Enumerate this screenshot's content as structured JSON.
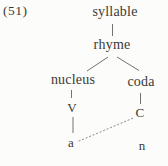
{
  "figure": {
    "label": "(51)"
  },
  "tree": {
    "title": "syllable structure tree",
    "nodes": [
      {
        "id": "syllable",
        "label": "syllable",
        "level": 0
      },
      {
        "id": "rhyme",
        "label": "rhyme",
        "level": 1
      },
      {
        "id": "nucleus",
        "label": "nucleus",
        "level": 2
      },
      {
        "id": "coda",
        "label": "coda",
        "level": 2
      },
      {
        "id": "v",
        "label": "V",
        "level": 3
      },
      {
        "id": "c",
        "label": "C",
        "level": 3
      },
      {
        "id": "a",
        "label": "a",
        "level": 4
      },
      {
        "id": "n",
        "label": "n",
        "level": 4
      }
    ],
    "edges": [
      {
        "from": "syllable",
        "to": "rhyme",
        "style": "solid"
      },
      {
        "from": "rhyme",
        "to": "nucleus",
        "style": "solid"
      },
      {
        "from": "rhyme",
        "to": "coda",
        "style": "solid"
      },
      {
        "from": "nucleus",
        "to": "V",
        "style": "solid"
      },
      {
        "from": "coda",
        "to": "C",
        "style": "solid"
      },
      {
        "from": "V",
        "to": "a",
        "style": "solid"
      },
      {
        "from": "a",
        "to": "C",
        "style": "dotted"
      }
    ]
  },
  "colors": {
    "background": "#fcfcfa",
    "text": "#3a3a36",
    "line": "#74726c",
    "dotted_line": "#8b8981"
  }
}
